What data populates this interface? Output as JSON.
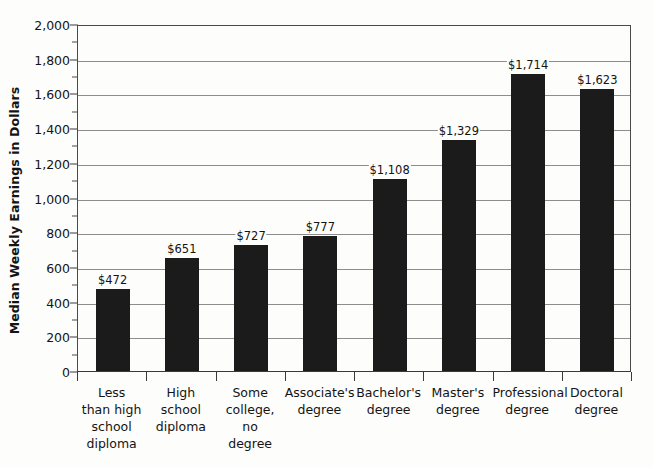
{
  "chart_data": {
    "type": "bar",
    "title": "",
    "subtitle": "",
    "xlabel": "",
    "ylabel": "Median Weekly Earnings in Dollars",
    "ylim": [
      0,
      2000
    ],
    "y_major_step": 200,
    "y_minor_step": 100,
    "grid": "horizontal-major-only",
    "legend": "none",
    "bar_color": "#1b1b1b",
    "categories": [
      "Less than high school diploma",
      "High school diploma",
      "Some college, no degree",
      "Associate's degree",
      "Bachelor's degree",
      "Master's degree",
      "Professional degree",
      "Doctoral degree"
    ],
    "category_lines": [
      [
        "Less",
        "than high",
        "school",
        "diploma"
      ],
      [
        "High",
        "school",
        "diploma"
      ],
      [
        "Some",
        "college,",
        "no",
        "degree"
      ],
      [
        "Associate's",
        "degree"
      ],
      [
        "Bachelor's",
        "degree"
      ],
      [
        "Master's",
        "degree"
      ],
      [
        "Professional",
        "degree"
      ],
      [
        "Doctoral",
        "degree"
      ]
    ],
    "values": [
      472,
      651,
      727,
      777,
      1108,
      1329,
      1714,
      1623
    ],
    "value_labels": [
      "$472",
      "$651",
      "$727",
      "$777",
      "$1,108",
      "$1,329",
      "$1,714",
      "$1,623"
    ],
    "y_tick_values": [
      0,
      200,
      400,
      600,
      800,
      1000,
      1200,
      1400,
      1600,
      1800,
      2000
    ],
    "y_tick_labels": [
      "0",
      "200",
      "400",
      "600",
      "800",
      "1,000",
      "1,200",
      "1,400",
      "1,600",
      "1,800",
      "2,000"
    ],
    "y_minor_tick_values": [
      100,
      300,
      500,
      700,
      900,
      1100,
      1300,
      1500,
      1700,
      1900
    ]
  }
}
